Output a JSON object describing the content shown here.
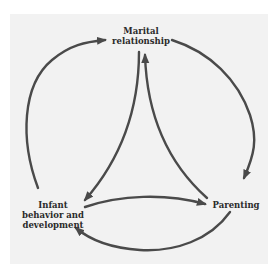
{
  "diagram": {
    "type": "cycle-with-triangle",
    "background_color": "#f2f2f2",
    "arrow_color": "#4a4a4a",
    "nodes": [
      {
        "id": "marital",
        "label": "Marital\nrelationship"
      },
      {
        "id": "infant",
        "label": "Infant\nbehavior and\ndevelopment"
      },
      {
        "id": "parenting",
        "label": "Parenting"
      }
    ],
    "edges": [
      {
        "from": "infant",
        "to": "marital",
        "style": "outer-arc"
      },
      {
        "from": "marital",
        "to": "parenting",
        "style": "outer-arc"
      },
      {
        "from": "parenting",
        "to": "infant",
        "style": "outer-arc"
      },
      {
        "from": "marital",
        "to": "infant",
        "style": "inner-curve"
      },
      {
        "from": "parenting",
        "to": "marital",
        "style": "inner-curve"
      },
      {
        "from": "infant",
        "to": "parenting",
        "style": "inner-curve"
      }
    ]
  }
}
